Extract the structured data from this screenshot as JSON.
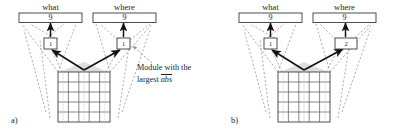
{
  "figure": {
    "panels": [
      {
        "id": "a",
        "label": "a)",
        "top_boxes": [
          {
            "name": "what",
            "caption": "what",
            "value": "9"
          },
          {
            "name": "where",
            "caption": "where",
            "value": "9"
          }
        ],
        "modules": [
          {
            "name": "module-left",
            "value": "1",
            "wide": false
          },
          {
            "name": "module-right",
            "value": "1",
            "wide": false
          }
        ],
        "grid": {
          "rows": 5,
          "cols": 5
        },
        "annotation": {
          "line1": "Module with the",
          "line2_prefix": "largest ",
          "line2_overlined": "abs"
        }
      },
      {
        "id": "b",
        "label": "b)",
        "top_boxes": [
          {
            "name": "what",
            "caption": "what",
            "value": "9"
          },
          {
            "name": "where",
            "caption": "where",
            "value": "9"
          }
        ],
        "modules": [
          {
            "name": "module-left",
            "value": "1",
            "wide": false
          },
          {
            "name": "module-right",
            "value": "2",
            "wide": true
          }
        ],
        "grid": {
          "rows": 5,
          "cols": 5
        },
        "annotation": null
      }
    ],
    "colors": {
      "ink": "#1d1d1d",
      "dashed": "#8e8e8e",
      "grid_line": "#4a4a4a",
      "grid_shade": "#d9d9d9",
      "box_stroke": "#3a3a3a",
      "background": "#ffffff"
    }
  }
}
